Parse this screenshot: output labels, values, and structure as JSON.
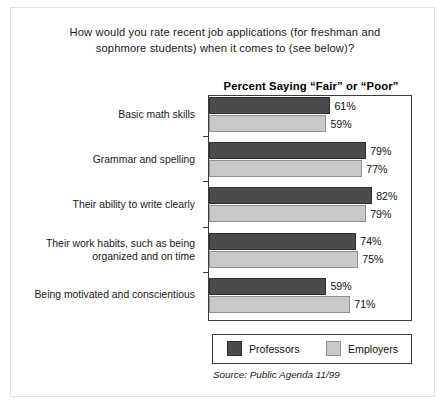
{
  "question": "How would you rate recent job applications (for freshman and sophmore students) when it comes to (see below)?",
  "source": "Source: Public Agenda  11/99",
  "legend": {
    "items": [
      {
        "label": "Professors",
        "color": "#4b4b4b"
      },
      {
        "label": "Employers",
        "color": "#c9c9c9"
      }
    ]
  },
  "chart_data": {
    "type": "bar",
    "orientation": "horizontal",
    "title": "Percent Saying “Fair” or “Poor”",
    "xlabel": "",
    "ylabel": "",
    "xlim": [
      0,
      102
    ],
    "grid": false,
    "legend_position": "bottom",
    "value_suffix": "%",
    "categories": [
      "Basic math skills",
      "Grammar and spelling",
      "Their ability to write clearly",
      "Their work habits, such as being organized and on time",
      "Being motivated and conscientious"
    ],
    "series": [
      {
        "name": "Professors",
        "color": "#4b4b4b",
        "values": [
          61,
          79,
          82,
          74,
          59
        ]
      },
      {
        "name": "Employers",
        "color": "#c9c9c9",
        "values": [
          59,
          77,
          79,
          75,
          71
        ]
      }
    ],
    "labels": {
      "Professors": [
        "61%",
        "79%",
        "82%",
        "74%",
        "59%"
      ],
      "Employers": [
        "59%",
        "77%",
        "79%",
        "75%",
        "71%"
      ]
    }
  }
}
